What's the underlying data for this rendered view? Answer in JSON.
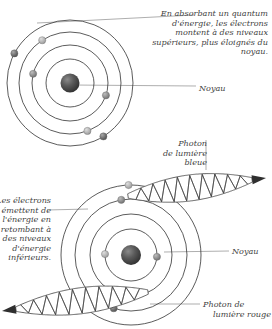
{
  "figure": {
    "title_absent": true,
    "language": "fr",
    "background": "#ffffff",
    "ink_color": "#3f3f3f"
  },
  "labels": {
    "absorption_note": "En absorbant un quantum d'énergie, les électrons montent à des niveaux supérieurs, plus éloignés du noyau.",
    "nucleus_top": "Noyau",
    "photon_blue_line1": "Photon",
    "photon_blue_line2": "de lumière",
    "photon_blue_line3": "bleue",
    "emission_note": "Les électrons émettent de l'énergie en retombant à des niveaux d'énergie inférieurs.",
    "nucleus_bottom": "Noyau",
    "photon_red_line1": "Photon de",
    "photon_red_line2": "lumière rouge"
  },
  "diagram": {
    "atoms": [
      {
        "id": "atom-top",
        "name": "atome-absorption",
        "cx": 70,
        "cy": 83,
        "nucleus_r": 9.5,
        "orbit_radii": [
          24,
          38,
          51,
          63
        ],
        "electrons": [
          {
            "orbit": 3,
            "angle_deg": 208,
            "shade": "dark"
          },
          {
            "orbit": 2,
            "angle_deg": 237,
            "shade": "light"
          },
          {
            "orbit": 1,
            "angle_deg": 194,
            "shade": "mid"
          },
          {
            "orbit": 1,
            "angle_deg": 19,
            "shade": "mid"
          },
          {
            "orbit": 2,
            "angle_deg": 70,
            "shade": "light"
          },
          {
            "orbit": 3,
            "angle_deg": 58,
            "shade": "dark"
          }
        ]
      },
      {
        "id": "atom-bottom",
        "name": "atome-emission",
        "cx": 131,
        "cy": 255,
        "nucleus_r": 10,
        "orbit_radii": [
          26,
          41,
          56,
          70
        ],
        "electrons": [
          {
            "orbit": 0,
            "angle_deg": 182,
            "shade": "light"
          },
          {
            "orbit": 0,
            "angle_deg": 4,
            "shade": "mid"
          },
          {
            "orbit": 1,
            "angle_deg": 102,
            "shade": "mid"
          },
          {
            "orbit": 2,
            "angle_deg": 108,
            "shade": "dark"
          },
          {
            "orbit": 2,
            "angle_deg": 260,
            "shade": "mid"
          },
          {
            "orbit": 3,
            "angle_deg": 268,
            "shade": "light"
          }
        ]
      }
    ],
    "photons": [
      {
        "id": "photon-blue",
        "name": "photon-lumiere-bleue",
        "direction": "right",
        "color": "#3f3f3f",
        "x1": 128,
        "y1": 196,
        "x2": 266,
        "y2": 178,
        "amplitude": 13,
        "cycles": 9
      },
      {
        "id": "photon-red",
        "name": "photon-lumiere-rouge",
        "direction": "left",
        "color": "#3f3f3f",
        "x1": 148,
        "y1": 292,
        "x2": 2,
        "y2": 311,
        "amplitude": 13,
        "cycles": 9
      }
    ],
    "leader_lines": [
      {
        "name": "leader-absorption",
        "x1": 37,
        "y1": 23,
        "x2": 194,
        "y2": 15
      },
      {
        "name": "leader-noyau-top",
        "x1": 72,
        "y1": 85,
        "x2": 196,
        "y2": 86
      },
      {
        "name": "leader-emission",
        "x1": 88,
        "y1": 209,
        "x2": 47,
        "y2": 210
      },
      {
        "name": "leader-noyau-bottom",
        "x1": 164,
        "y1": 252,
        "x2": 229,
        "y2": 251
      },
      {
        "name": "leader-photon-rouge",
        "x1": 150,
        "y1": 304,
        "x2": 200,
        "y2": 304
      },
      {
        "name": "leader-photon-bleue",
        "x1": 206,
        "y1": 140,
        "x2": 206,
        "y2": 170
      }
    ]
  }
}
